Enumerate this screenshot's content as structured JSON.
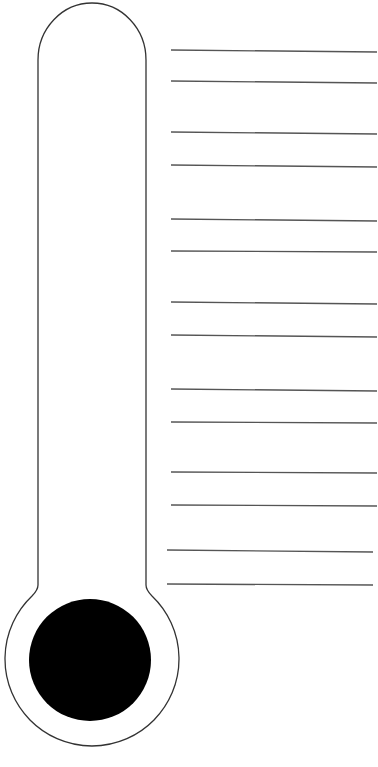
{
  "worksheet": {
    "type": "goal-thermometer",
    "colors": {
      "outline": "#333333",
      "bulb_fill": "#000000",
      "rule_line": "#555555",
      "background": "#ffffff"
    },
    "rule_lines": [
      {
        "y1": 50,
        "y2": 52
      },
      {
        "y1": 81,
        "y2": 83
      },
      {
        "y1": 132,
        "y2": 134
      },
      {
        "y1": 165,
        "y2": 167
      },
      {
        "y1": 219,
        "y2": 221
      },
      {
        "y1": 251,
        "y2": 252
      },
      {
        "y1": 302,
        "y2": 304
      },
      {
        "y1": 335,
        "y2": 337
      },
      {
        "y1": 389,
        "y2": 391
      },
      {
        "y1": 422,
        "y2": 423
      },
      {
        "y1": 472,
        "y2": 473
      },
      {
        "y1": 505,
        "y2": 506
      },
      {
        "y1": 550,
        "y2": 552
      },
      {
        "y1": 584,
        "y2": 585
      }
    ],
    "caption": ""
  }
}
